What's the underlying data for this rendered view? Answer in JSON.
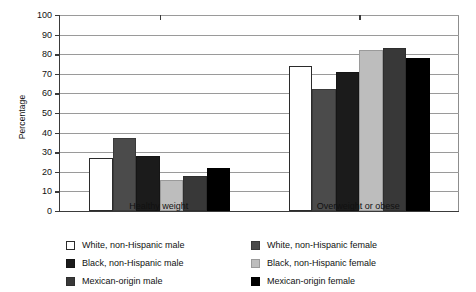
{
  "chart_data": {
    "type": "bar",
    "title": "",
    "xlabel": "",
    "ylabel": "Percentage",
    "ylim": [
      0,
      100
    ],
    "ytick_step": 10,
    "grid": true,
    "legend_position": "bottom",
    "categories": [
      "Healthy weight",
      "Overweight or obese"
    ],
    "ytick_labels": [
      "100",
      "90",
      "80",
      "70",
      "60",
      "50",
      "40",
      "30",
      "20",
      "10",
      "0"
    ],
    "series": [
      {
        "name": "White, non-Hispanic male",
        "color": "#ffffff",
        "swatch": "sw-white",
        "values": [
          27,
          74
        ]
      },
      {
        "name": "White, non-Hispanic female",
        "color": "#4b4b4b",
        "swatch": "sw-dgray",
        "values": [
          37,
          62
        ]
      },
      {
        "name": "Black, non-Hispanic male",
        "color": "#1b1b1b",
        "swatch": "sw-black1",
        "values": [
          28,
          71
        ]
      },
      {
        "name": "Black, non-Hispanic female",
        "color": "#bdbdbd",
        "swatch": "sw-lgray",
        "values": [
          16,
          82
        ]
      },
      {
        "name": "Mexican-origin male",
        "color": "#383838",
        "swatch": "sw-dgray2",
        "values": [
          18,
          83
        ]
      },
      {
        "name": "Mexican-origin female",
        "color": "#000000",
        "swatch": "sw-black2",
        "values": [
          22,
          78
        ]
      }
    ],
    "legend_entries": [
      "White, non-Hispanic male",
      "White, non-Hispanic female",
      "Black, non-Hispanic male",
      "Black, non-Hispanic female",
      "Mexican-origin male",
      "Mexican-origin female"
    ]
  }
}
